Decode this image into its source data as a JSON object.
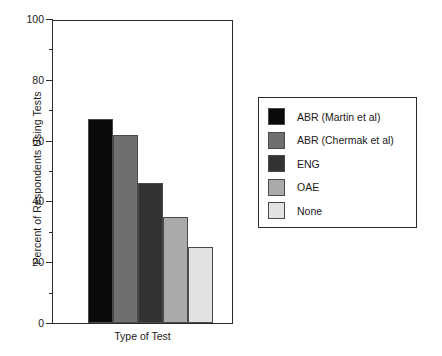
{
  "chart_data": {
    "type": "bar",
    "title": "",
    "xlabel": "Type of Test",
    "ylabel": "Percent of Respondents Using Tests",
    "categories": [
      "ABR (Martin et al)",
      "ABR (Chermak et al)",
      "ENG",
      "OAE",
      "None"
    ],
    "values": [
      67,
      62,
      46,
      35,
      25
    ],
    "ylim": [
      0,
      100
    ],
    "yticks": [
      0,
      20,
      40,
      60,
      80,
      100
    ],
    "ytick_labels": [
      "0",
      "20",
      "40",
      "60",
      "80",
      "100"
    ],
    "yticks_minor": [
      10,
      30,
      50,
      70,
      90
    ],
    "xtick_labels": [],
    "grid": false,
    "legend_position": "right-outside",
    "bar_colors": [
      "#0a0a0a",
      "#6f6f6f",
      "#333333",
      "#aaaaaa",
      "#e2e2e2"
    ],
    "bar_edge_color": "#4a4a4a",
    "axis_color": "#2b2b2b",
    "series": [
      {
        "name": "Percent of Respondents Using Tests",
        "points": [
          {
            "label": "ABR (Martin et al)",
            "value": 67,
            "color": "#0a0a0a"
          },
          {
            "label": "ABR (Chermak et al)",
            "value": 62,
            "color": "#6f6f6f"
          },
          {
            "label": "ENG",
            "value": 46,
            "color": "#333333"
          },
          {
            "label": "OAE",
            "value": 35,
            "color": "#aaaaaa"
          },
          {
            "label": "None",
            "value": 25,
            "color": "#e2e2e2"
          }
        ]
      }
    ]
  },
  "legend": {
    "items": [
      {
        "label": "ABR (Martin et al)",
        "color": "#0a0a0a"
      },
      {
        "label": "ABR (Chermak et al)",
        "color": "#6f6f6f"
      },
      {
        "label": "ENG",
        "color": "#333333"
      },
      {
        "label": "OAE",
        "color": "#aaaaaa"
      },
      {
        "label": "None",
        "color": "#e2e2e2"
      }
    ]
  }
}
